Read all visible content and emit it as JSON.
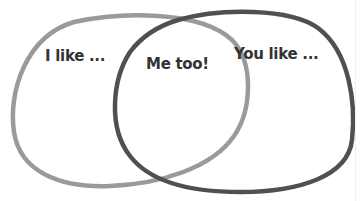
{
  "diagram": {
    "type": "venn",
    "sets": [
      {
        "id": "left",
        "label": "I like ...",
        "stroke": "#9a9a9a"
      },
      {
        "id": "right",
        "label": "You like ...",
        "stroke": "#505050"
      }
    ],
    "intersection": {
      "label": "Me too!"
    },
    "text_color": "#333333",
    "background": "#ffffff"
  }
}
